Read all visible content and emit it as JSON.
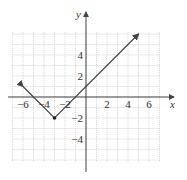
{
  "chart_data": {
    "type": "line",
    "title": "",
    "function": "y = |x + 3| - 2",
    "xlabel": "x",
    "ylabel": "y",
    "xlim": [
      -7,
      7
    ],
    "ylim": [
      -7,
      7
    ],
    "grid": true,
    "x_tick_labels": [
      "-6",
      "-4",
      "-2",
      "2",
      "4",
      "6"
    ],
    "y_tick_labels": [
      "4",
      "2",
      "-2",
      "-4"
    ],
    "series": [
      {
        "name": "graph",
        "points": [
          [
            -6,
            1
          ],
          [
            -3,
            -2
          ],
          [
            5,
            6
          ]
        ],
        "arrows": "both-ends",
        "vertex": [
          -3,
          -2
        ]
      }
    ],
    "colors": {
      "line": "#444444",
      "grid": "#bbbbbb",
      "axis": "#444444"
    }
  },
  "labels": {
    "x_axis": "x",
    "y_axis": "y",
    "xt": [
      "−6",
      "−4",
      "−2",
      "2",
      "4",
      "6"
    ],
    "yt": [
      "4",
      "2",
      "−2",
      "−4"
    ]
  }
}
